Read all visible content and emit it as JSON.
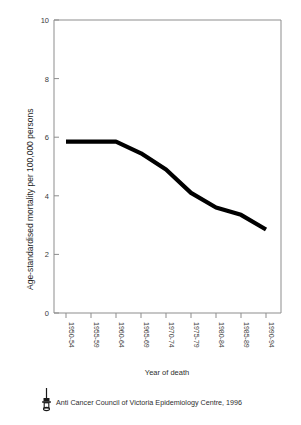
{
  "chart_data": {
    "type": "line",
    "title": "",
    "xlabel": "Year of death",
    "ylabel": "Age-standardised mortality per 100,000 persons",
    "categories": [
      "1950-54",
      "1955-59",
      "1960-64",
      "1965-69",
      "1970-74",
      "1975-79",
      "1980-84",
      "1985-89",
      "1990-94"
    ],
    "values": [
      5.85,
      5.85,
      5.85,
      5.45,
      4.9,
      4.1,
      3.6,
      3.35,
      2.85
    ],
    "series": [
      {
        "name": "Age-standardised mortality",
        "values": [
          5.85,
          5.85,
          5.85,
          5.45,
          4.9,
          4.1,
          3.6,
          3.35,
          2.85
        ]
      }
    ],
    "ylim": [
      0,
      10
    ],
    "yticks": [
      "0",
      "2",
      "4",
      "6",
      "8",
      "10"
    ],
    "ytick_values": [
      0,
      2,
      4,
      6,
      8,
      10
    ],
    "grid": false,
    "legend": "none",
    "line_color": "#000000"
  },
  "axes": {
    "y_tick_labels": [
      "10",
      "8",
      "6",
      "4",
      "2",
      "0"
    ],
    "x_axis_title": "Year of death",
    "y_axis_title": "Age-standardised mortality per 100,000 persons"
  },
  "xticks": {
    "t0": "1950-54",
    "t1": "1955-59",
    "t2": "1960-64",
    "t3": "1965-69",
    "t4": "1970-74",
    "t5": "1975-79",
    "t6": "1980-84",
    "t7": "1985-89",
    "t8": "1990-94"
  },
  "yticks": {
    "v10": "10",
    "v8": "8",
    "v6": "6",
    "v4": "4",
    "v2": "2",
    "v0": "0"
  },
  "footer": {
    "logo_name": "torch-logo",
    "credit": "Anti Cancer Council of Victoria Epidemiology Centre, 1996"
  },
  "colors": {
    "line": "#000000",
    "axis": "#8d8d8d",
    "text": "#2e2e2e",
    "background": "#ffffff"
  }
}
